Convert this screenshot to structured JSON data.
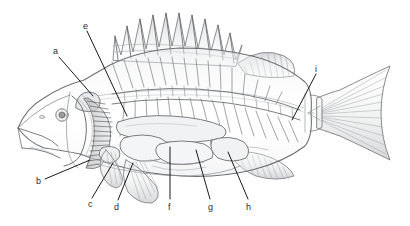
{
  "figure": {
    "style": "pencil line drawing",
    "background_color": "#ffffff",
    "ink_color": "#6d6f72",
    "label_color": "#2b2b2b",
    "leader_color": "#1a1a1a"
  },
  "labels": [
    {
      "id": "a",
      "text": "a",
      "x": 53,
      "y": 47,
      "leader": {
        "x1": 59,
        "y1": 57,
        "x2": 93,
        "y2": 96
      }
    },
    {
      "id": "b",
      "text": "b",
      "x": 36,
      "y": 177,
      "leader": {
        "x1": 45,
        "y1": 179,
        "x2": 90,
        "y2": 160
      }
    },
    {
      "id": "c",
      "text": "c",
      "x": 88,
      "y": 200,
      "leader": {
        "x1": 92,
        "y1": 198,
        "x2": 113,
        "y2": 163
      }
    },
    {
      "id": "d",
      "text": "d",
      "x": 114,
      "y": 203,
      "leader": {
        "x1": 118,
        "y1": 200,
        "x2": 133,
        "y2": 163
      }
    },
    {
      "id": "e",
      "text": "e",
      "x": 83,
      "y": 22,
      "leader": {
        "x1": 87,
        "y1": 31,
        "x2": 127,
        "y2": 116
      }
    },
    {
      "id": "f",
      "text": "f",
      "x": 168,
      "y": 203,
      "leader": {
        "x1": 170,
        "y1": 199,
        "x2": 170,
        "y2": 147
      }
    },
    {
      "id": "g",
      "text": "g",
      "x": 208,
      "y": 203,
      "leader": {
        "x1": 210,
        "y1": 199,
        "x2": 196,
        "y2": 150
      }
    },
    {
      "id": "h",
      "text": "h",
      "x": 246,
      "y": 203,
      "leader": {
        "x1": 248,
        "y1": 199,
        "x2": 228,
        "y2": 152
      }
    },
    {
      "id": "i",
      "text": "i",
      "x": 315,
      "y": 65,
      "leader": {
        "x1": 316,
        "y1": 74,
        "x2": 292,
        "y2": 120
      }
    }
  ],
  "parts": [
    {
      "name": "spiny-dorsal-fin"
    },
    {
      "name": "soft-dorsal-fin"
    },
    {
      "name": "caudal-fin"
    },
    {
      "name": "anal-fin"
    },
    {
      "name": "pelvic-fin"
    },
    {
      "name": "pectoral-fin"
    },
    {
      "name": "gill-filaments"
    },
    {
      "name": "operculum"
    },
    {
      "name": "eye"
    },
    {
      "name": "mouth"
    },
    {
      "name": "vertebral-column"
    },
    {
      "name": "ribs"
    },
    {
      "name": "swim-bladder"
    },
    {
      "name": "stomach"
    },
    {
      "name": "intestine"
    },
    {
      "name": "kidney"
    },
    {
      "name": "brain"
    },
    {
      "name": "body-outline"
    },
    {
      "name": "lateral-line"
    }
  ]
}
